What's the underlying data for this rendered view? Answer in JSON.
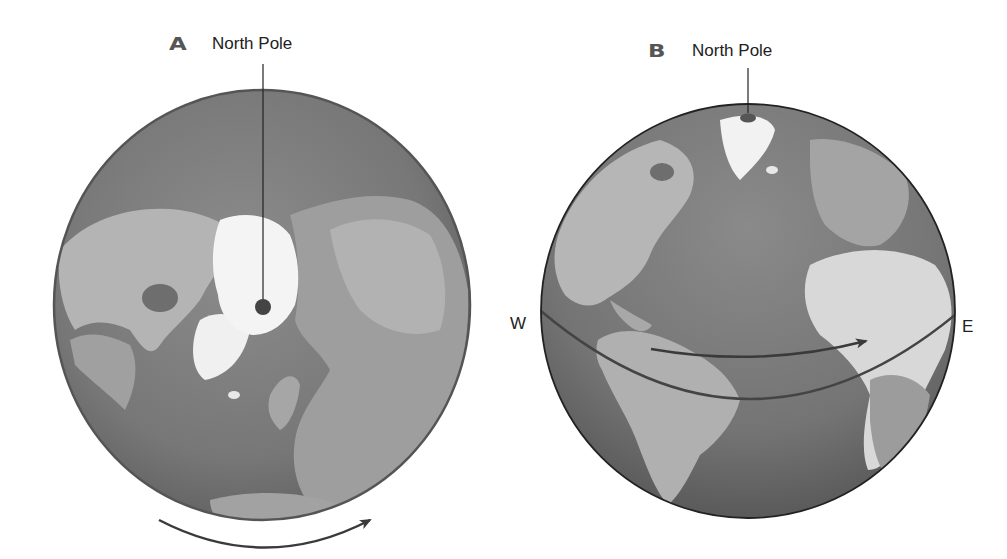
{
  "figure": {
    "panels": [
      {
        "id": "A",
        "letter": "A",
        "pole_label": "North Pole",
        "view": "polar view from above the North Pole",
        "rotation_arrow": "counterclockwise as seen from above (arrow left-to-right along bottom)"
      },
      {
        "id": "B",
        "letter": "B",
        "pole_label": "North Pole",
        "view": "side view showing the equator",
        "west_label": "W",
        "east_label": "E",
        "rotation_arrow": "west to east"
      }
    ],
    "colors": {
      "ocean": "#7a7a7a",
      "land": "#a8a8a8",
      "ice": "#f2f2f2",
      "outline": "#333333",
      "arrow": "#3a3a3a",
      "pole_dot": "#444444"
    }
  }
}
